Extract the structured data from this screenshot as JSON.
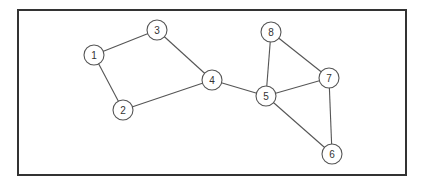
{
  "diagram": {
    "type": "undirected-graph",
    "node_radius": 10,
    "colors": {
      "stroke": "#555555",
      "frame": "#333333",
      "fill": "#ffffff",
      "text": "#333333"
    },
    "nodes": [
      {
        "id": "1",
        "label": "1",
        "x": 94,
        "y": 55
      },
      {
        "id": "2",
        "label": "2",
        "x": 123,
        "y": 110
      },
      {
        "id": "3",
        "label": "3",
        "x": 157,
        "y": 30
      },
      {
        "id": "4",
        "label": "4",
        "x": 212,
        "y": 80
      },
      {
        "id": "5",
        "label": "5",
        "x": 266,
        "y": 96
      },
      {
        "id": "6",
        "label": "6",
        "x": 332,
        "y": 154
      },
      {
        "id": "7",
        "label": "7",
        "x": 329,
        "y": 78
      },
      {
        "id": "8",
        "label": "8",
        "x": 271,
        "y": 32
      }
    ],
    "edges": [
      [
        "1",
        "3"
      ],
      [
        "1",
        "2"
      ],
      [
        "3",
        "4"
      ],
      [
        "2",
        "4"
      ],
      [
        "4",
        "5"
      ],
      [
        "5",
        "8"
      ],
      [
        "8",
        "7"
      ],
      [
        "5",
        "7"
      ],
      [
        "5",
        "6"
      ],
      [
        "7",
        "6"
      ]
    ]
  }
}
